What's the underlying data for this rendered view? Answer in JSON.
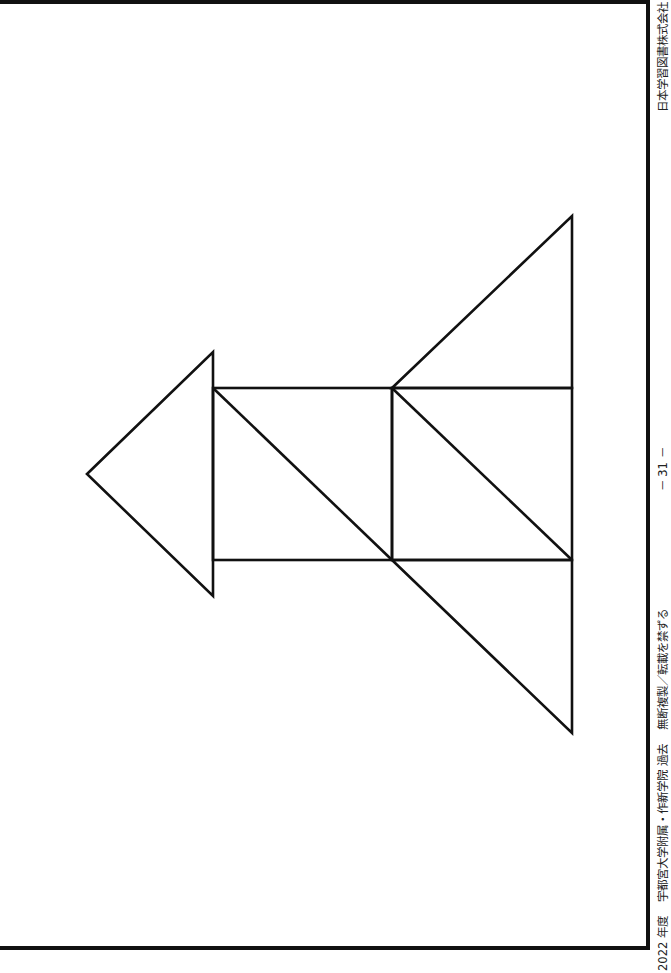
{
  "footer": {
    "year": "2022 年度",
    "school": "宇都宮大学附属・作新学院 過去",
    "notice": "無断複製／転載を禁ずる",
    "page": "－ 31 －",
    "publisher": "日本学習図書株式会社"
  },
  "figure": {
    "stroke_color": "#111111",
    "shapes": [
      {
        "name": "left-triangle",
        "points": [
          [
            87,
            474
          ],
          [
            213,
            352
          ],
          [
            213,
            596
          ]
        ]
      },
      {
        "name": "left-square",
        "rect": [
          213,
          388,
          179,
          172
        ]
      },
      {
        "name": "left-square-diagonal",
        "line": [
          213,
          388,
          392,
          560
        ]
      },
      {
        "name": "right-square",
        "rect": [
          392,
          388,
          180,
          172
        ]
      },
      {
        "name": "right-square-diagonal",
        "line": [
          392,
          388,
          572,
          560
        ]
      },
      {
        "name": "top-right-triangle",
        "points": [
          [
            392,
            388
          ],
          [
            572,
            216
          ],
          [
            572,
            388
          ]
        ]
      },
      {
        "name": "bottom-right-triangle",
        "points": [
          [
            392,
            560
          ],
          [
            572,
            560
          ],
          [
            572,
            733
          ]
        ]
      }
    ]
  }
}
